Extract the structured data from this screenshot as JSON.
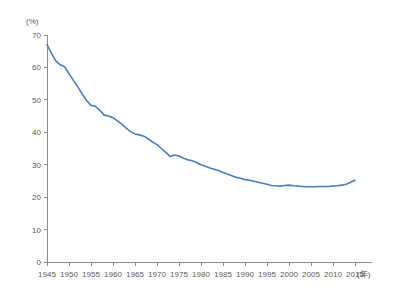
{
  "chart_data": {
    "type": "line",
    "title": "",
    "subtitle": "",
    "xlabel": "(年)",
    "ylabel": "(%)",
    "xlim": [
      1945,
      2016
    ],
    "ylim": [
      0,
      70
    ],
    "grid": false,
    "legend": false,
    "legend_position": "none",
    "line_color": "#4a7ebb",
    "axis_color": "#808080",
    "text_color": "#595959",
    "y_ticks": [
      0,
      10,
      20,
      30,
      40,
      50,
      60,
      70
    ],
    "y_tick_labels": [
      "0",
      "10",
      "20",
      "30",
      "40",
      "50",
      "60",
      "70"
    ],
    "x_ticks": [
      1945,
      1950,
      1955,
      1960,
      1965,
      1970,
      1975,
      1980,
      1985,
      1990,
      1995,
      2000,
      2005,
      2010,
      2015
    ],
    "x_tick_labels": [
      "1945",
      "1950",
      "1955",
      "1960",
      "1965",
      "1970",
      "1975",
      "1980",
      "1985",
      "1990",
      "1995",
      "2000",
      "2005",
      "2010",
      "2015"
    ],
    "x_axis_unit_suffix": "(年)",
    "y_axis_unit": "(%)",
    "series": [
      {
        "name": "",
        "x": [
          1945,
          1946,
          1947,
          1948,
          1949,
          1950,
          1951,
          1952,
          1953,
          1954,
          1955,
          1956,
          1957,
          1958,
          1959,
          1960,
          1961,
          1962,
          1963,
          1964,
          1965,
          1966,
          1967,
          1968,
          1969,
          1970,
          1971,
          1972,
          1973,
          1974,
          1975,
          1976,
          1977,
          1978,
          1979,
          1980,
          1981,
          1982,
          1983,
          1984,
          1985,
          1986,
          1987,
          1988,
          1989,
          1990,
          1991,
          1992,
          1993,
          1994,
          1995,
          1996,
          1997,
          1998,
          1999,
          2000,
          2001,
          2002,
          2003,
          2004,
          2005,
          2006,
          2007,
          2008,
          2009,
          2010,
          2011,
          2012,
          2013,
          2014,
          2015
        ],
        "values": [
          67.0,
          64.4,
          62.0,
          60.8,
          60.2,
          58.1,
          56.0,
          54.0,
          51.8,
          49.8,
          48.3,
          48.0,
          46.8,
          45.3,
          45.0,
          44.5,
          43.5,
          42.5,
          41.3,
          40.2,
          39.5,
          39.2,
          38.8,
          38.0,
          37.0,
          36.2,
          35.0,
          33.8,
          32.5,
          33.0,
          32.7,
          32.0,
          31.5,
          31.2,
          30.7,
          30.0,
          29.5,
          29.0,
          28.6,
          28.2,
          27.6,
          27.1,
          26.6,
          26.1,
          25.8,
          25.4,
          25.2,
          24.9,
          24.6,
          24.3,
          24.0,
          23.6,
          23.5,
          23.4,
          23.6,
          23.7,
          23.5,
          23.4,
          23.3,
          23.2,
          23.2,
          23.2,
          23.3,
          23.3,
          23.3,
          23.4,
          23.5,
          23.7,
          24.0,
          24.6,
          25.2
        ]
      }
    ]
  }
}
